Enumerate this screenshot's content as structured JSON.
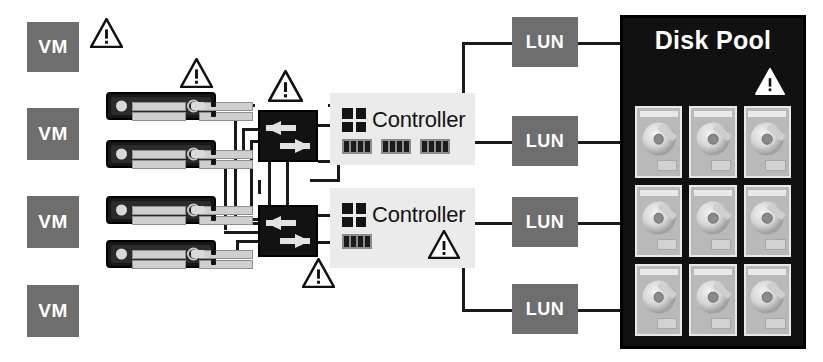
{
  "diagram": {
    "colors": {
      "vm_fill": "#6e6e6e",
      "lun_fill": "#6e6e6e",
      "pool_fill": "#111111",
      "controller_fill": "#ebebeb",
      "switch_fill": "#121212",
      "wire": "#1a1a1a",
      "text_light": "#ffffff",
      "text_dark": "#141414"
    },
    "vms": [
      {
        "label": "VM"
      },
      {
        "label": "VM"
      },
      {
        "label": "VM"
      },
      {
        "label": "VM"
      }
    ],
    "servers": [
      {
        "name": "server-appliance-1"
      },
      {
        "name": "server-appliance-2"
      },
      {
        "name": "server-appliance-3"
      },
      {
        "name": "server-appliance-4"
      }
    ],
    "switches": [
      {
        "name": "fabric-switch-1",
        "icon": "bidirectional-arrows-icon"
      },
      {
        "name": "fabric-switch-2",
        "icon": "bidirectional-arrows-icon"
      }
    ],
    "controllers": [
      {
        "label": "Controller",
        "icon": "controller-grid-icon",
        "port_groups": 3,
        "ports_per_group": 4,
        "has_warning": false
      },
      {
        "label": "Controller",
        "icon": "controller-grid-icon",
        "port_groups": 1,
        "ports_per_group": 4,
        "has_warning": true
      }
    ],
    "luns": [
      {
        "label": "LUN"
      },
      {
        "label": "LUN"
      },
      {
        "label": "LUN"
      },
      {
        "label": "LUN"
      }
    ],
    "disk_pool": {
      "title": "Disk Pool",
      "rows": 3,
      "columns": 3,
      "disk_count": 9,
      "has_warning": true,
      "warning_icon": "warning-triangle-icon"
    },
    "warnings": [
      {
        "name": "warning-vm-1",
        "icon": "warning-triangle-icon"
      },
      {
        "name": "warning-server-top",
        "icon": "warning-triangle-icon"
      },
      {
        "name": "warning-switch-1",
        "icon": "warning-triangle-icon"
      },
      {
        "name": "warning-switch-2",
        "icon": "warning-triangle-icon"
      },
      {
        "name": "warning-controller-2",
        "icon": "warning-triangle-icon"
      },
      {
        "name": "warning-disk-pool",
        "icon": "warning-triangle-icon"
      }
    ]
  }
}
